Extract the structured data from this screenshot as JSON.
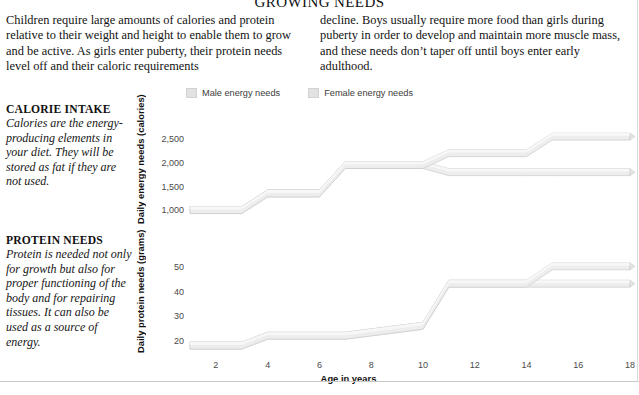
{
  "title": "GROWING NEEDS",
  "intro": {
    "left": "Children require large amounts of calories and protein relative to their weight and height to enable them to grow and be active. As girls enter puberty, their protein needs level off and their caloric requirements",
    "right": "decline. Boys usually require more food than girls during puberty in order to develop and maintain more muscle mass, and these needs don’t taper off until boys enter early adulthood."
  },
  "notes": [
    {
      "heading": "CALORIE INTAKE",
      "body": "Calories are the energy-producing elements in your diet. They will be stored as fat if they are not used."
    },
    {
      "heading": "PROTEIN NEEDS",
      "body": "Protein is needed not only for growth but also for proper functioning of the body and for repairing tissues. It can also be used as a source of energy."
    }
  ],
  "legend": {
    "male_label": "Male energy needs",
    "female_label": "Female energy needs",
    "swatch_color": "#e2e2e2"
  },
  "colors": {
    "ribbon_face": "#ededed",
    "ribbon_top": "#f7f7f7",
    "ribbon_edge": "#cccccc",
    "text": "#111111",
    "tick_text": "#4a4a4a",
    "rule": "#c9c9c9"
  },
  "chart_data": [
    {
      "type": "line",
      "title": "Calorie intake",
      "xlabel": "Age in years",
      "ylabel": "Daily energy needs (calories)",
      "xlim": [
        1,
        18
      ],
      "ylim": [
        900,
        2800
      ],
      "xticks": [
        2,
        4,
        6,
        8,
        10,
        12,
        14,
        16,
        18
      ],
      "yticks": [
        1000,
        1500,
        2000,
        2500
      ],
      "ytick_labels": [
        "1,000",
        "1,500",
        "2,000",
        "2,500"
      ],
      "grid": false,
      "legend_position": "top",
      "x": [
        1,
        3,
        4,
        6,
        7,
        10,
        11,
        14,
        15,
        18
      ],
      "series": [
        {
          "name": "Male energy needs",
          "values": [
            1100,
            1100,
            1450,
            1450,
            2050,
            2050,
            2300,
            2300,
            2650,
            2650
          ]
        },
        {
          "name": "Female energy needs",
          "values": [
            1100,
            1100,
            1450,
            1450,
            2050,
            2050,
            1900,
            1900,
            1900,
            1900
          ]
        }
      ]
    },
    {
      "type": "line",
      "title": "Protein needs",
      "xlabel": "Age in years",
      "ylabel": "Daily protein needs (grams)",
      "xlim": [
        1,
        18
      ],
      "ylim": [
        16,
        58
      ],
      "xticks": [
        2,
        4,
        6,
        8,
        10,
        12,
        14,
        16,
        18
      ],
      "yticks": [
        20,
        30,
        40,
        50
      ],
      "ytick_labels": [
        "20",
        "30",
        "40",
        "50"
      ],
      "grid": false,
      "legend_position": "top",
      "x": [
        1,
        3,
        4,
        7,
        10,
        11,
        14,
        15,
        18
      ],
      "series": [
        {
          "name": "Male protein needs",
          "values": [
            20,
            20,
            24,
            24,
            28,
            45,
            45,
            52,
            52
          ]
        },
        {
          "name": "Female protein needs",
          "values": [
            20,
            20,
            24,
            24,
            28,
            45,
            45,
            45,
            45
          ]
        }
      ]
    }
  ],
  "xaxis": {
    "ticks": [
      "2",
      "4",
      "6",
      "8",
      "10",
      "12",
      "14",
      "16",
      "18"
    ],
    "label": "Age in years"
  }
}
